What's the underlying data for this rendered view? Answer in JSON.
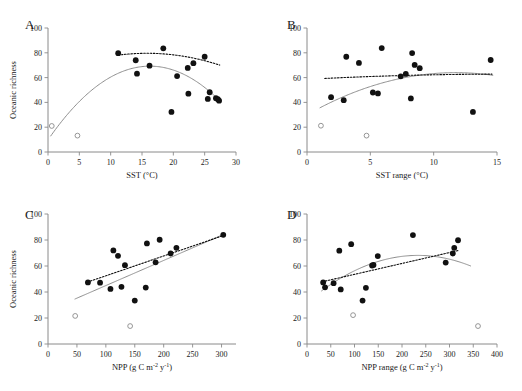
{
  "figure": {
    "width": 522,
    "height": 391,
    "background": "#ffffff",
    "point_color": "#111111",
    "open_point_stroke": "#8a8a8a",
    "solid_fit_color": "#8e8e8e",
    "dotted_fit_color": "#111111",
    "axis_color": "#8a8a8a",
    "shared_ylabel": "Oceanic richness",
    "panel_letters": [
      "A",
      "B",
      "C",
      "D"
    ]
  },
  "chart_data": [
    {
      "panel": "A",
      "type": "scatter",
      "title": "A",
      "xlabel": "SST (°C)",
      "ylabel": "Oceanic richness",
      "xlim": [
        0,
        30
      ],
      "ylim": [
        0,
        100
      ],
      "xticks": [
        0,
        5,
        10,
        15,
        20,
        25,
        30
      ],
      "xtick_labels": [
        "0",
        "5",
        "10",
        "15",
        "20",
        "25",
        "30"
      ],
      "yticks": [
        0,
        20,
        40,
        60,
        80,
        100
      ],
      "ytick_labels": [
        "0",
        "20",
        "40",
        "60",
        "80",
        "100"
      ],
      "grid": false,
      "legend": "none",
      "series": [
        {
          "name": "continental sites",
          "marker": "filled-circle",
          "points": [
            [
              11.2,
              79.7
            ],
            [
              14.0,
              74.0
            ],
            [
              14.2,
              63.2
            ],
            [
              16.2,
              69.6
            ],
            [
              18.4,
              83.6
            ],
            [
              19.7,
              32.3
            ],
            [
              20.6,
              61.2
            ],
            [
              22.3,
              67.8
            ],
            [
              22.4,
              47.0
            ],
            [
              23.2,
              71.6
            ],
            [
              25.0,
              76.8
            ],
            [
              25.5,
              42.8
            ],
            [
              25.8,
              48.2
            ],
            [
              26.8,
              43.4
            ],
            [
              27.1,
              42.6
            ],
            [
              27.3,
              41.4
            ]
          ]
        },
        {
          "name": "island outliers",
          "marker": "open-circle",
          "points": [
            [
              0.6,
              21.0
            ],
            [
              4.7,
              13.2
            ]
          ]
        }
      ],
      "fits": [
        {
          "name": "quadratic-all",
          "style": "solid",
          "kind": "quadratic",
          "xrange": [
            0.4,
            27.6
          ],
          "coefficients": {
            "a": -0.2248,
            "b": 7.31,
            "c": 9.8
          }
        },
        {
          "name": "linear-filled-only",
          "style": "dotted",
          "kind": "quadratic",
          "xrange": [
            11.2,
            27.4
          ],
          "coefficients": {
            "a": -0.0706,
            "b": 2.23,
            "c": 62.0
          }
        }
      ]
    },
    {
      "panel": "B",
      "type": "scatter",
      "title": "B",
      "xlabel": "SST range (°C)",
      "ylabel": "Oceanic richness",
      "xlim": [
        0,
        15
      ],
      "ylim": [
        0,
        100
      ],
      "xticks": [
        0,
        5,
        10,
        15
      ],
      "xtick_labels": [
        "0",
        "5",
        "10",
        "15"
      ],
      "yticks": [
        0,
        20,
        40,
        60,
        80,
        100
      ],
      "ytick_labels": [
        "0",
        "20",
        "40",
        "60",
        "80",
        "100"
      ],
      "grid": false,
      "legend": "none",
      "series": [
        {
          "name": "continental sites",
          "marker": "filled-circle",
          "points": [
            [
              1.9,
              44.2
            ],
            [
              2.9,
              41.8
            ],
            [
              3.1,
              76.8
            ],
            [
              4.1,
              71.8
            ],
            [
              5.2,
              48.0
            ],
            [
              5.6,
              47.2
            ],
            [
              5.9,
              83.8
            ],
            [
              7.4,
              61.0
            ],
            [
              7.8,
              63.0
            ],
            [
              8.2,
              43.2
            ],
            [
              8.3,
              79.8
            ],
            [
              8.5,
              70.2
            ],
            [
              8.9,
              67.6
            ],
            [
              13.1,
              32.3
            ],
            [
              14.5,
              74.2
            ]
          ]
        },
        {
          "name": "island outliers",
          "marker": "open-circle",
          "points": [
            [
              1.1,
              21.2
            ],
            [
              4.7,
              13.2
            ]
          ]
        }
      ],
      "fits": [
        {
          "name": "quadratic-all",
          "style": "solid",
          "kind": "quadratic",
          "xrange": [
            1.0,
            14.7
          ],
          "coefficients": {
            "a": -0.2466,
            "b": 5.79,
            "c": 30.0
          }
        },
        {
          "name": "linear-filled-only",
          "style": "dotted",
          "kind": "quadratic",
          "xrange": [
            1.4,
            14.6
          ],
          "coefficients": {
            "a": -0.0173,
            "b": 0.54,
            "c": 58.6
          }
        }
      ]
    },
    {
      "panel": "C",
      "type": "scatter",
      "title": "C",
      "xlabel": "NPP (g C m⁻² y⁻¹)",
      "ylabel": "Oceanic richness",
      "xlim": [
        0,
        325
      ],
      "ylim": [
        0,
        100
      ],
      "xticks": [
        0,
        50,
        100,
        150,
        200,
        250,
        300
      ],
      "xtick_labels": [
        "0",
        "50",
        "100",
        "150",
        "200",
        "250",
        "300"
      ],
      "yticks": [
        0,
        20,
        40,
        60,
        80,
        100
      ],
      "ytick_labels": [
        "0",
        "20",
        "40",
        "60",
        "80",
        "100"
      ],
      "grid": false,
      "legend": "none",
      "series": [
        {
          "name": "continental sites",
          "marker": "filled-circle",
          "points": [
            [
              69,
              47.4
            ],
            [
              90,
              47.2
            ],
            [
              108,
              42.4
            ],
            [
              113,
              72.0
            ],
            [
              121,
              67.8
            ],
            [
              127,
              44.0
            ],
            [
              133,
              60.6
            ],
            [
              150,
              33.4
            ],
            [
              169,
              43.4
            ],
            [
              171,
              77.4
            ],
            [
              186,
              62.8
            ],
            [
              193,
              80.2
            ],
            [
              212,
              69.6
            ],
            [
              222,
              74.0
            ],
            [
              303,
              84.0
            ]
          ]
        },
        {
          "name": "island outliers",
          "marker": "open-circle",
          "points": [
            [
              47,
              21.6
            ],
            [
              142,
              13.8
            ]
          ]
        }
      ],
      "fits": [
        {
          "name": "linear-all",
          "style": "solid",
          "kind": "linear",
          "xrange": [
            46,
            305
          ],
          "coefficients": {
            "m": 0.1934,
            "b": 25.6
          }
        },
        {
          "name": "linear-filled-only",
          "style": "dotted",
          "kind": "linear",
          "xrange": [
            68,
            304
          ],
          "coefficients": {
            "m": 0.1525,
            "b": 37.2
          }
        }
      ]
    },
    {
      "panel": "D",
      "type": "scatter",
      "title": "D",
      "xlabel": "NPP range (g C m⁻² y⁻¹)",
      "ylabel": "Oceanic richness",
      "xlim": [
        0,
        400
      ],
      "ylim": [
        0,
        100
      ],
      "xticks": [
        0,
        50,
        100,
        150,
        200,
        250,
        300,
        350,
        400
      ],
      "xtick_labels": [
        "0",
        "50",
        "100",
        "150",
        "200",
        "250",
        "300",
        "350",
        "400"
      ],
      "yticks": [
        0,
        20,
        40,
        60,
        80,
        100
      ],
      "ytick_labels": [
        "0",
        "20",
        "40",
        "60",
        "80",
        "100"
      ],
      "grid": false,
      "legend": "none",
      "series": [
        {
          "name": "continental sites",
          "marker": "filled-circle",
          "points": [
            [
              34,
              47.4
            ],
            [
              38,
              43.6
            ],
            [
              56,
              46.8
            ],
            [
              68,
              71.8
            ],
            [
              71,
              42.0
            ],
            [
              93,
              76.8
            ],
            [
              117,
              33.4
            ],
            [
              124,
              43.2
            ],
            [
              137,
              60.4
            ],
            [
              140,
              60.8
            ],
            [
              149,
              67.6
            ],
            [
              223,
              83.8
            ],
            [
              292,
              62.6
            ],
            [
              307,
              69.6
            ],
            [
              310,
              74.0
            ],
            [
              318,
              79.8
            ]
          ]
        },
        {
          "name": "island outliers",
          "marker": "open-circle",
          "points": [
            [
              97,
              22.2
            ],
            [
              360,
              13.8
            ]
          ]
        }
      ],
      "fits": [
        {
          "name": "quadratic-all",
          "style": "solid",
          "kind": "quadratic",
          "xrange": [
            30,
            345
          ],
          "coefficients": {
            "a": -0.000662,
            "b": 0.3094,
            "c": 32.0
          }
        },
        {
          "name": "linear-filled-only",
          "style": "dotted",
          "kind": "linear",
          "xrange": [
            32,
            320
          ],
          "coefficients": {
            "m": 0.0838,
            "b": 45.2
          }
        }
      ]
    }
  ]
}
